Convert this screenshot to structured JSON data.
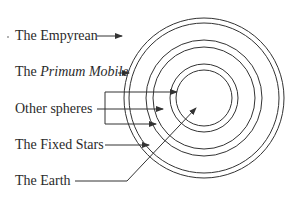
{
  "diagram": {
    "colors": {
      "line": "#333333",
      "text": "#2a2a2a",
      "background": "#ffffff"
    },
    "labels": [
      {
        "id": "empyrean",
        "prefix": "The ",
        "emph": "",
        "text": "The Empyrean",
        "y": 28
      },
      {
        "id": "primum-mobile",
        "prefix": "The ",
        "emph": "Primum Mobile",
        "text": "The Primum Mobile",
        "y": 64
      },
      {
        "id": "other-spheres",
        "prefix": "",
        "emph": "",
        "text": "Other spheres",
        "y": 101
      },
      {
        "id": "fixed-stars",
        "prefix": "",
        "emph": "",
        "text": "The Fixed Stars",
        "y": 137
      },
      {
        "id": "earth",
        "prefix": "",
        "emph": "",
        "text": "The Earth",
        "y": 173
      }
    ],
    "circles": {
      "center": [
        204,
        98
      ],
      "radii": [
        80,
        75,
        58,
        51,
        34,
        28
      ]
    },
    "connectors": [
      {
        "for": "empyrean",
        "points": [
          [
            97,
            36
          ],
          [
            122,
            36
          ]
        ],
        "arrow": true
      },
      {
        "for": "primum-mobile",
        "points": [
          [
            118,
            73
          ],
          [
            129,
            73
          ]
        ],
        "arrow": true
      },
      {
        "for": "other-spheres",
        "points": [
          [
            97,
            109
          ],
          [
            163,
            109
          ]
        ],
        "arrow": true
      },
      {
        "for": "other-spheres-bracket",
        "points": [
          [
            105,
            92
          ],
          [
            105,
            124
          ]
        ],
        "arrow": false
      },
      {
        "for": "other-spheres-top",
        "points": [
          [
            105,
            92
          ],
          [
            177,
            92
          ]
        ],
        "arrow": true
      },
      {
        "for": "other-spheres-bottom",
        "points": [
          [
            105,
            124
          ],
          [
            156,
            124
          ]
        ],
        "arrow": true
      },
      {
        "for": "fixed-stars",
        "points": [
          [
            105,
            145
          ],
          [
            149,
            145
          ]
        ],
        "arrow": true
      },
      {
        "for": "earth",
        "points": [
          [
            75,
            181
          ],
          [
            127,
            181
          ],
          [
            196,
            108
          ]
        ],
        "arrow": true
      }
    ]
  }
}
